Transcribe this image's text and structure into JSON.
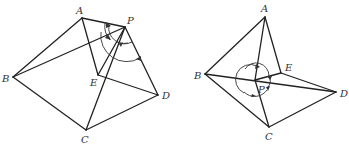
{
  "figures": [
    {
      "id": "left",
      "labels": {
        "A": "A",
        "B": "B",
        "C": "C",
        "D": "D",
        "E": "E",
        "P": "P"
      },
      "points": {
        "A": [
          82,
          18
        ],
        "P": [
          125,
          27
        ],
        "B": [
          13,
          77
        ],
        "E": [
          98,
          75
        ],
        "D": [
          158,
          95
        ],
        "C": [
          86,
          130
        ]
      },
      "segments": [
        [
          "A",
          "P"
        ],
        [
          "A",
          "B"
        ],
        [
          "A",
          "E"
        ],
        [
          "B",
          "P"
        ],
        [
          "B",
          "C"
        ],
        [
          "P",
          "C"
        ],
        [
          "P",
          "D"
        ],
        [
          "E",
          "D"
        ],
        [
          "C",
          "D"
        ],
        [
          "P",
          "E"
        ]
      ]
    },
    {
      "id": "right",
      "labels": {
        "A": "A",
        "B": "B",
        "C": "C",
        "D": "D",
        "E": "E",
        "P": "P"
      },
      "points": {
        "A": [
          265,
          17
        ],
        "B": [
          205,
          74
        ],
        "E": [
          281,
          73
        ],
        "D": [
          336,
          92
        ],
        "C": [
          269,
          127
        ],
        "P": [
          255,
          80
        ]
      },
      "segments": [
        [
          "A",
          "B"
        ],
        [
          "A",
          "E"
        ],
        [
          "A",
          "P"
        ],
        [
          "B",
          "C"
        ],
        [
          "B",
          "D"
        ],
        [
          "P",
          "C"
        ],
        [
          "P",
          "E"
        ],
        [
          "E",
          "D"
        ],
        [
          "C",
          "D"
        ]
      ]
    }
  ],
  "colors": {
    "line": "#222222",
    "text": "#333333",
    "background": "#ffffff"
  }
}
